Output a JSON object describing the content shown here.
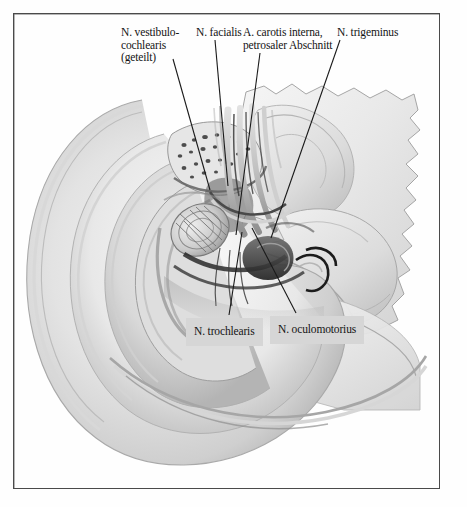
{
  "figure": {
    "kind": "anatomical-illustration",
    "rendering": "grayscale halftone drawing",
    "frame_color": "#4a4a4a",
    "background_color": "#fefefe",
    "label_box_color": "#d6d6d6",
    "leader_line_color": "#1a1a1a"
  },
  "labels": {
    "vestibulocochlearis": "N. vestibulo-\ncochlearis\n(geteilt)",
    "facialis": "N. facialis",
    "carotis": "A. carotis interna,\npetrosaler Abschnitt",
    "trigeminus": "N. trigeminus",
    "trochlearis": "N. trochlearis",
    "oculomotorius": "N. oculomotorius"
  },
  "leader_lines": [
    {
      "name": "leader-vestibulocochlearis",
      "x1": 173,
      "y1": 59,
      "x2": 210,
      "y2": 190
    },
    {
      "name": "leader-facialis",
      "x1": 215,
      "y1": 40,
      "x2": 228,
      "y2": 186
    },
    {
      "name": "leader-carotis",
      "x1": 260,
      "y1": 53,
      "x2": 236,
      "y2": 235
    },
    {
      "name": "leader-trigeminus",
      "x1": 340,
      "y1": 40,
      "x2": 271,
      "y2": 238
    },
    {
      "name": "leader-trochlearis",
      "x1": 229,
      "y1": 315,
      "x2": 242,
      "y2": 232
    },
    {
      "name": "leader-oculomotorius",
      "x1": 296,
      "y1": 313,
      "x2": 252,
      "y2": 228
    }
  ]
}
